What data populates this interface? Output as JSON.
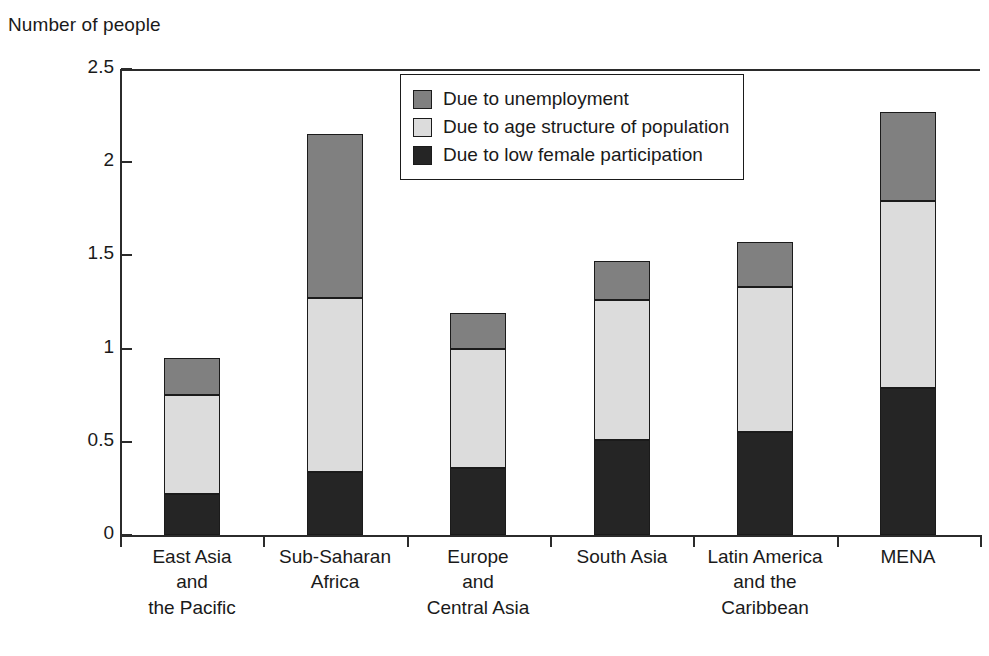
{
  "chart_data": {
    "type": "bar",
    "subtype": "stacked-vertical",
    "title": "",
    "ylabel": "Number of people",
    "xlabel": "",
    "ylim": [
      0,
      2.5
    ],
    "yticks": [
      "0",
      "0.5",
      "1",
      "1.5",
      "2",
      "2.5"
    ],
    "ytick_values": [
      0,
      0.5,
      1,
      1.5,
      2,
      2.5
    ],
    "grid": false,
    "legend_position": "upper-center",
    "categories": [
      "East Asia\nand\nthe Pacific",
      "Sub-Saharan\nAfrica",
      "Europe\nand\nCentral Asia",
      "South Asia",
      "Latin America\nand the\nCaribbean",
      "MENA"
    ],
    "series": [
      {
        "name": "Due to low female participation",
        "color": "#252525",
        "values": [
          0.22,
          0.34,
          0.36,
          0.51,
          0.55,
          0.79
        ]
      },
      {
        "name": "Due to age structure of population",
        "color": "#dcdcdc",
        "values": [
          0.53,
          0.93,
          0.64,
          0.75,
          0.78,
          1.0
        ]
      },
      {
        "name": "Due to unemployment",
        "color": "#808080",
        "values": [
          0.2,
          0.88,
          0.19,
          0.21,
          0.24,
          0.48
        ]
      }
    ],
    "totals": [
      0.95,
      2.15,
      1.19,
      1.47,
      1.57,
      2.27
    ],
    "legend_order": [
      "Due to unemployment",
      "Due to age structure of population",
      "Due to low female participation"
    ]
  },
  "axis": {
    "y_title": "Number of people"
  },
  "colors": {
    "unemployment": "#808080",
    "age_structure": "#dcdcdc",
    "female_participation": "#252525",
    "axis": "#2b2b2b",
    "outline": "#1b1b1b"
  }
}
